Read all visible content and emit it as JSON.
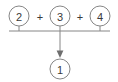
{
  "diagram": {
    "type": "merge-arrow-diagram",
    "background_color": "#ffffff",
    "stroke_color": "#868686",
    "text_color": "#3a3a3a",
    "operands": [
      {
        "id": "node-2",
        "label": "2",
        "cx": 19,
        "cy": 16,
        "r": 10
      },
      {
        "id": "node-3",
        "label": "3",
        "cx": 60,
        "cy": 16,
        "r": 10
      },
      {
        "id": "node-4",
        "label": "4",
        "cx": 100,
        "cy": 16,
        "r": 10
      }
    ],
    "operators": [
      {
        "id": "operator-1",
        "label": "+",
        "x": 40,
        "y": 17
      },
      {
        "id": "operator-2",
        "label": "+",
        "x": 80,
        "y": 17
      }
    ],
    "result": {
      "id": "node-1",
      "label": "1",
      "cx": 60,
      "cy": 69,
      "r": 10
    },
    "bus_line": {
      "x1": 9,
      "x2": 110,
      "y": 31
    },
    "arrow": {
      "x": 60,
      "y1": 31,
      "y2": 57
    }
  }
}
